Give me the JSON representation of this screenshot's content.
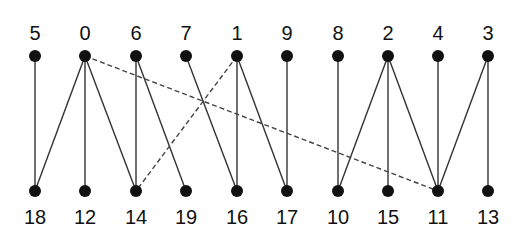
{
  "diagram": {
    "type": "bipartite-graph",
    "colors": {
      "node": "#111111",
      "edge": "#333333",
      "dashed_edge": "#444444",
      "background": "#ffffff"
    },
    "top_nodes": [
      {
        "id": "5",
        "label": "5",
        "x": 35
      },
      {
        "id": "0",
        "label": "0",
        "x": 85
      },
      {
        "id": "6",
        "label": "6",
        "x": 136
      },
      {
        "id": "7",
        "label": "7",
        "x": 186
      },
      {
        "id": "1",
        "label": "1",
        "x": 237
      },
      {
        "id": "9",
        "label": "9",
        "x": 287
      },
      {
        "id": "8",
        "label": "8",
        "x": 338
      },
      {
        "id": "2",
        "label": "2",
        "x": 388
      },
      {
        "id": "4",
        "label": "4",
        "x": 438
      },
      {
        "id": "3",
        "label": "3",
        "x": 488
      }
    ],
    "bottom_nodes": [
      {
        "id": "18",
        "label": "18",
        "x": 35
      },
      {
        "id": "12",
        "label": "12",
        "x": 85
      },
      {
        "id": "14",
        "label": "14",
        "x": 136
      },
      {
        "id": "19",
        "label": "19",
        "x": 186
      },
      {
        "id": "16",
        "label": "16",
        "x": 237
      },
      {
        "id": "17",
        "label": "17",
        "x": 287
      },
      {
        "id": "10",
        "label": "10",
        "x": 338
      },
      {
        "id": "15",
        "label": "15",
        "x": 388
      },
      {
        "id": "11",
        "label": "11",
        "x": 438
      },
      {
        "id": "13",
        "label": "13",
        "x": 488
      }
    ],
    "edges": [
      {
        "from": "5",
        "to": "18",
        "style": "solid"
      },
      {
        "from": "0",
        "to": "18",
        "style": "solid"
      },
      {
        "from": "0",
        "to": "12",
        "style": "solid"
      },
      {
        "from": "0",
        "to": "14",
        "style": "solid"
      },
      {
        "from": "6",
        "to": "14",
        "style": "solid"
      },
      {
        "from": "6",
        "to": "19",
        "style": "solid"
      },
      {
        "from": "7",
        "to": "16",
        "style": "solid"
      },
      {
        "from": "1",
        "to": "16",
        "style": "solid"
      },
      {
        "from": "1",
        "to": "17",
        "style": "solid"
      },
      {
        "from": "9",
        "to": "17",
        "style": "solid"
      },
      {
        "from": "8",
        "to": "10",
        "style": "solid"
      },
      {
        "from": "2",
        "to": "10",
        "style": "solid"
      },
      {
        "from": "2",
        "to": "15",
        "style": "solid"
      },
      {
        "from": "2",
        "to": "11",
        "style": "solid"
      },
      {
        "from": "4",
        "to": "11",
        "style": "solid"
      },
      {
        "from": "3",
        "to": "11",
        "style": "solid"
      },
      {
        "from": "3",
        "to": "13",
        "style": "solid"
      },
      {
        "from": "0",
        "to": "11",
        "style": "dashed"
      },
      {
        "from": "1",
        "to": "14",
        "style": "dashed"
      }
    ]
  }
}
